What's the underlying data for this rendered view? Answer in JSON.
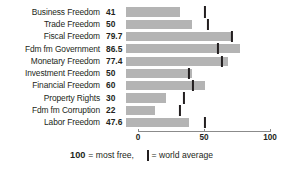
{
  "chart_data": {
    "type": "bar",
    "orientation": "horizontal",
    "title": "",
    "xlabel": "",
    "ylabel": "",
    "xlim": [
      0,
      100
    ],
    "grid": false,
    "legend_position": "bottom",
    "axis_ticks": [
      {
        "value": 0,
        "label": "0"
      },
      {
        "value": 50,
        "label": "50"
      },
      {
        "value": 100,
        "label": "100"
      }
    ],
    "categories": [
      "Business Freedom",
      "Trade Freedom",
      "Fiscal Freedom",
      "Fdm fm Government",
      "Monetary Freedom",
      "Investment Freedom",
      "Financial Freedom",
      "Property Rights",
      "Fdm fm Corruption",
      "Labor Freedom"
    ],
    "values": [
      41,
      50,
      79.7,
      86.5,
      77.4,
      50,
      60,
      30,
      22,
      47.6
    ],
    "value_labels": [
      "41",
      "50",
      "79.7",
      "86.5",
      "77.4",
      "50",
      "60",
      "30",
      "22",
      "47.6"
    ],
    "series": [
      {
        "name": "Country score",
        "values": [
          41,
          50,
          79.7,
          86.5,
          77.4,
          50,
          60,
          30,
          22,
          47.6
        ]
      },
      {
        "name": "World average",
        "marker": "vertical-tick",
        "values": [
          60,
          62,
          80,
          70,
          73,
          48,
          51,
          44,
          41,
          60
        ]
      }
    ],
    "rows": [
      {
        "label": "Business Freedom",
        "value_label": "41",
        "value": 41,
        "world_average": 60
      },
      {
        "label": "Trade Freedom",
        "value_label": "50",
        "value": 50,
        "world_average": 62
      },
      {
        "label": "Fiscal Freedom",
        "value_label": "79.7",
        "value": 79.7,
        "world_average": 80
      },
      {
        "label": "Fdm fm Government",
        "value_label": "86.5",
        "value": 86.5,
        "world_average": 70
      },
      {
        "label": "Monetary Freedom",
        "value_label": "77.4",
        "value": 77.4,
        "world_average": 73
      },
      {
        "label": "Investment Freedom",
        "value_label": "50",
        "value": 50,
        "world_average": 48
      },
      {
        "label": "Financial Freedom",
        "value_label": "60",
        "value": 60,
        "world_average": 51
      },
      {
        "label": "Property Rights",
        "value_label": "30",
        "value": 30,
        "world_average": 44
      },
      {
        "label": "Fdm fm Corruption",
        "value_label": "22",
        "value": 22,
        "world_average": 41
      },
      {
        "label": "Labor Freedom",
        "value_label": "47.6",
        "value": 47.6,
        "world_average": 60
      }
    ],
    "colors": {
      "bar": "#b4b4b4",
      "tick": "#231f20",
      "axis": "#8b8b8b",
      "text": "#231f20",
      "background": "#ffffff"
    }
  },
  "legend": {
    "max_label": "100",
    "max_text": "= most free,",
    "average_text": "= world average"
  }
}
